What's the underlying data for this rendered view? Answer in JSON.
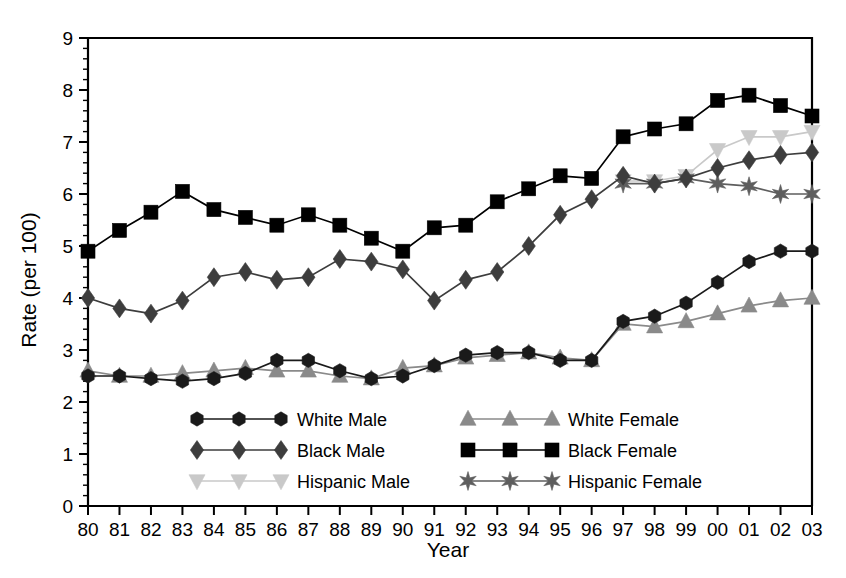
{
  "chart_data": {
    "type": "line",
    "title": "",
    "xlabel": "Year",
    "ylabel": "Rate (per 100)",
    "grid": false,
    "legend_position": "inside-bottom-center",
    "xlim": [
      1980,
      2003
    ],
    "ylim": [
      0,
      9
    ],
    "yticks": [
      0,
      1,
      2,
      3,
      4,
      5,
      6,
      7,
      8,
      9
    ],
    "ytick_labels": [
      "0",
      "1",
      "2",
      "3",
      "4",
      "5",
      "6",
      "7",
      "8",
      "9"
    ],
    "y_minor_ticks_per_interval": 5,
    "x": [
      1980,
      1981,
      1982,
      1983,
      1984,
      1985,
      1986,
      1987,
      1988,
      1989,
      1990,
      1991,
      1992,
      1993,
      1994,
      1995,
      1996,
      1997,
      1998,
      1999,
      2000,
      2001,
      2002,
      2003
    ],
    "xtick_labels": [
      "80",
      "81",
      "82",
      "83",
      "84",
      "85",
      "86",
      "87",
      "88",
      "89",
      "90",
      "91",
      "92",
      "93",
      "94",
      "95",
      "96",
      "97",
      "98",
      "99",
      "00",
      "01",
      "02",
      "03"
    ],
    "series": [
      {
        "name": "White Male",
        "marker": "hexagon",
        "color": "#1a1a1a",
        "line_color": "#1a1a1a",
        "values": [
          2.5,
          2.5,
          2.45,
          2.4,
          2.45,
          2.55,
          2.8,
          2.8,
          2.6,
          2.45,
          2.5,
          2.7,
          2.9,
          2.95,
          2.95,
          2.8,
          2.8,
          3.55,
          3.65,
          3.9,
          4.3,
          4.7,
          4.9,
          4.9
        ]
      },
      {
        "name": "Black Male",
        "marker": "diamond",
        "color": "#3d3d3d",
        "line_color": "#3d3d3d",
        "values": [
          4.0,
          3.8,
          3.7,
          3.95,
          4.4,
          4.5,
          4.35,
          4.4,
          4.75,
          4.7,
          4.55,
          3.95,
          4.35,
          4.5,
          5.0,
          5.6,
          5.9,
          6.35,
          6.2,
          6.3,
          6.5,
          6.65,
          6.75,
          6.8
        ]
      },
      {
        "name": "Hispanic Male",
        "marker": "triangle-down",
        "color": "#c9c9c9",
        "line_color": "#c9c9c9",
        "values": [
          null,
          null,
          null,
          null,
          null,
          null,
          null,
          null,
          null,
          null,
          null,
          null,
          null,
          null,
          null,
          null,
          null,
          6.25,
          6.25,
          6.35,
          6.85,
          7.1,
          7.1,
          7.2
        ]
      },
      {
        "name": "White Female",
        "marker": "triangle-up",
        "color": "#8a8a8a",
        "line_color": "#8a8a8a",
        "values": [
          2.6,
          2.5,
          2.5,
          2.55,
          2.6,
          2.65,
          2.6,
          2.6,
          2.5,
          2.45,
          2.65,
          2.7,
          2.85,
          2.9,
          2.95,
          2.85,
          2.8,
          3.5,
          3.45,
          3.55,
          3.7,
          3.85,
          3.95,
          4.0
        ]
      },
      {
        "name": "Black Female",
        "marker": "square",
        "color": "#000000",
        "line_color": "#000000",
        "values": [
          4.9,
          5.3,
          5.65,
          6.05,
          5.7,
          5.55,
          5.4,
          5.6,
          5.4,
          5.15,
          4.9,
          5.35,
          5.4,
          5.85,
          6.1,
          6.35,
          6.3,
          7.1,
          7.25,
          7.35,
          7.8,
          7.9,
          7.7,
          7.5
        ]
      },
      {
        "name": "Hispanic Female",
        "marker": "star",
        "color": "#5e5e5e",
        "line_color": "#5e5e5e",
        "values": [
          null,
          null,
          null,
          null,
          null,
          null,
          null,
          null,
          null,
          null,
          null,
          null,
          null,
          null,
          null,
          null,
          null,
          6.2,
          6.2,
          6.3,
          6.2,
          6.15,
          6.0,
          6.0
        ]
      }
    ]
  },
  "legend": {
    "entries": [
      {
        "label": "White Male"
      },
      {
        "label": "White Female"
      },
      {
        "label": "Black Male"
      },
      {
        "label": "Black Female"
      },
      {
        "label": "Hispanic Male"
      },
      {
        "label": "Hispanic Female"
      }
    ]
  }
}
